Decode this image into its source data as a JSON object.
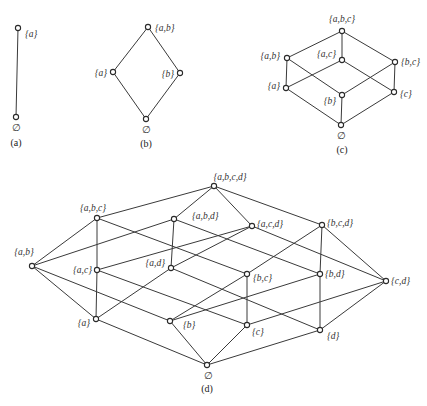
{
  "diagrams": [
    {
      "caption": "(a)",
      "caption_pos": [
        16,
        146
      ],
      "nodes": [
        {
          "id": "a",
          "label": "{a}",
          "x": 18,
          "y": 28,
          "lx": 25,
          "ly": 37,
          "anchor": "start"
        },
        {
          "id": "e",
          "label": "∅",
          "x": 16,
          "y": 117,
          "lx": 16,
          "ly": 131,
          "anchor": "middle"
        }
      ],
      "edges": [
        [
          "e",
          "a"
        ]
      ]
    },
    {
      "caption": "(b)",
      "caption_pos": [
        146,
        147
      ],
      "nodes": [
        {
          "id": "ab",
          "label": "{a,b}",
          "x": 148,
          "y": 27,
          "lx": 155,
          "ly": 31,
          "anchor": "start"
        },
        {
          "id": "a",
          "label": "{a}",
          "x": 113,
          "y": 72,
          "lx": 107,
          "ly": 76,
          "anchor": "end"
        },
        {
          "id": "b",
          "label": "{b}",
          "x": 180,
          "y": 73,
          "lx": 174,
          "ly": 77,
          "anchor": "end"
        },
        {
          "id": "e",
          "label": "∅",
          "x": 146,
          "y": 119,
          "lx": 146,
          "ly": 133,
          "anchor": "middle"
        }
      ],
      "edges": [
        [
          "e",
          "a"
        ],
        [
          "e",
          "b"
        ],
        [
          "a",
          "ab"
        ],
        [
          "b",
          "ab"
        ]
      ]
    },
    {
      "caption": "(c)",
      "caption_pos": [
        342,
        153
      ],
      "nodes": [
        {
          "id": "abc",
          "label": "{a,b,c}",
          "x": 342,
          "y": 31,
          "lx": 342,
          "ly": 22,
          "anchor": "middle"
        },
        {
          "id": "ab",
          "label": "{a,b}",
          "x": 287,
          "y": 58,
          "lx": 280,
          "ly": 59,
          "anchor": "end"
        },
        {
          "id": "ac",
          "label": "{a,c}",
          "x": 342,
          "y": 60,
          "lx": 336,
          "ly": 57,
          "anchor": "end"
        },
        {
          "id": "bc",
          "label": "{b,c}",
          "x": 395,
          "y": 62,
          "lx": 401,
          "ly": 65,
          "anchor": "start"
        },
        {
          "id": "a",
          "label": "{a}",
          "x": 286,
          "y": 88,
          "lx": 280,
          "ly": 89,
          "anchor": "end"
        },
        {
          "id": "b",
          "label": "{b}",
          "x": 342,
          "y": 95,
          "lx": 336,
          "ly": 104,
          "anchor": "end"
        },
        {
          "id": "c",
          "label": "{c}",
          "x": 394,
          "y": 92,
          "lx": 400,
          "ly": 97,
          "anchor": "start"
        },
        {
          "id": "e",
          "label": "∅",
          "x": 341,
          "y": 125,
          "lx": 341,
          "ly": 139,
          "anchor": "middle"
        }
      ],
      "edges": [
        [
          "e",
          "a"
        ],
        [
          "e",
          "b"
        ],
        [
          "e",
          "c"
        ],
        [
          "a",
          "ab"
        ],
        [
          "a",
          "ac"
        ],
        [
          "b",
          "ab"
        ],
        [
          "b",
          "bc"
        ],
        [
          "c",
          "ac"
        ],
        [
          "c",
          "bc"
        ],
        [
          "ab",
          "abc"
        ],
        [
          "ac",
          "abc"
        ],
        [
          "bc",
          "abc"
        ]
      ]
    },
    {
      "caption": "(d)",
      "caption_pos": [
        207,
        392
      ],
      "nodes": [
        {
          "id": "abcd",
          "label": "{a,b,c,d}",
          "x": 214,
          "y": 186,
          "lx": 230,
          "ly": 180,
          "anchor": "middle"
        },
        {
          "id": "abc",
          "label": "{a,b,c}",
          "x": 97,
          "y": 218,
          "lx": 93,
          "ly": 211,
          "anchor": "middle"
        },
        {
          "id": "abd",
          "label": "{a,b,d}",
          "x": 174,
          "y": 219,
          "lx": 192,
          "ly": 219,
          "anchor": "start"
        },
        {
          "id": "acd",
          "label": "{a,c,d}",
          "x": 252,
          "y": 226,
          "lx": 257,
          "ly": 227,
          "anchor": "start"
        },
        {
          "id": "bcd",
          "label": "{b,c,d}",
          "x": 322,
          "y": 225,
          "lx": 327,
          "ly": 226,
          "anchor": "start"
        },
        {
          "id": "ab",
          "label": "{a,b}",
          "x": 32,
          "y": 266,
          "lx": 24,
          "ly": 255,
          "anchor": "middle"
        },
        {
          "id": "ac",
          "label": "{a,c}",
          "x": 97,
          "y": 270,
          "lx": 92,
          "ly": 273,
          "anchor": "end"
        },
        {
          "id": "ad",
          "label": "{a,d}",
          "x": 171,
          "y": 268,
          "lx": 165,
          "ly": 266,
          "anchor": "end"
        },
        {
          "id": "bc",
          "label": "{b,c}",
          "x": 247,
          "y": 274,
          "lx": 253,
          "ly": 281,
          "anchor": "start"
        },
        {
          "id": "bd",
          "label": "{b,d}",
          "x": 320,
          "y": 274,
          "lx": 325,
          "ly": 277,
          "anchor": "start"
        },
        {
          "id": "cd",
          "label": "{c,d}",
          "x": 386,
          "y": 281,
          "lx": 391,
          "ly": 284,
          "anchor": "start"
        },
        {
          "id": "a",
          "label": "{a}",
          "x": 96,
          "y": 319,
          "lx": 90,
          "ly": 326,
          "anchor": "end"
        },
        {
          "id": "b",
          "label": "{b}",
          "x": 170,
          "y": 321,
          "lx": 183,
          "ly": 328,
          "anchor": "start"
        },
        {
          "id": "c",
          "label": "{c}",
          "x": 247,
          "y": 325,
          "lx": 252,
          "ly": 335,
          "anchor": "start"
        },
        {
          "id": "d",
          "label": "{d}",
          "x": 320,
          "y": 330,
          "lx": 327,
          "ly": 339,
          "anchor": "start"
        },
        {
          "id": "e",
          "label": "∅",
          "x": 207,
          "y": 365,
          "lx": 208,
          "ly": 379,
          "anchor": "middle"
        }
      ],
      "edges": [
        [
          "e",
          "a"
        ],
        [
          "e",
          "b"
        ],
        [
          "e",
          "c"
        ],
        [
          "e",
          "d"
        ],
        [
          "a",
          "ab"
        ],
        [
          "a",
          "ac"
        ],
        [
          "a",
          "ad"
        ],
        [
          "b",
          "ab"
        ],
        [
          "b",
          "bc"
        ],
        [
          "b",
          "bd"
        ],
        [
          "c",
          "ac"
        ],
        [
          "c",
          "bc"
        ],
        [
          "c",
          "cd"
        ],
        [
          "d",
          "ad"
        ],
        [
          "d",
          "bd"
        ],
        [
          "d",
          "cd"
        ],
        [
          "ab",
          "abc"
        ],
        [
          "ab",
          "abd"
        ],
        [
          "ac",
          "abc"
        ],
        [
          "ac",
          "acd"
        ],
        [
          "ad",
          "abd"
        ],
        [
          "ad",
          "acd"
        ],
        [
          "bc",
          "abc"
        ],
        [
          "bc",
          "bcd"
        ],
        [
          "bd",
          "abd"
        ],
        [
          "bd",
          "bcd"
        ],
        [
          "cd",
          "acd"
        ],
        [
          "cd",
          "bcd"
        ],
        [
          "abc",
          "abcd"
        ],
        [
          "abd",
          "abcd"
        ],
        [
          "acd",
          "abcd"
        ],
        [
          "bcd",
          "abcd"
        ]
      ]
    }
  ]
}
